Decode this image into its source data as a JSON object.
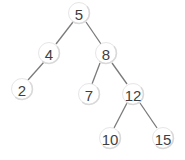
{
  "diagram": {
    "type": "binary-search-tree",
    "colors": {
      "edge": "#7a7a7a",
      "node_fill": "#ffffff",
      "node_shadow": "#d9d9d9",
      "label": "#3f3f3f"
    },
    "nodes": [
      {
        "id": "n5",
        "label": "5",
        "x": 79,
        "y": 13
      },
      {
        "id": "n4",
        "label": "4",
        "x": 49,
        "y": 53
      },
      {
        "id": "n8",
        "label": "8",
        "x": 106,
        "y": 53
      },
      {
        "id": "n2",
        "label": "2",
        "x": 22,
        "y": 89
      },
      {
        "id": "n7",
        "label": "7",
        "x": 89,
        "y": 94
      },
      {
        "id": "n12",
        "label": "12",
        "x": 133,
        "y": 94
      },
      {
        "id": "n10",
        "label": "10",
        "x": 110,
        "y": 138
      },
      {
        "id": "n15",
        "label": "15",
        "x": 163,
        "y": 138
      }
    ],
    "edges": [
      {
        "from": "5",
        "to": "4",
        "x1": 73,
        "y1": 22,
        "x2": 56,
        "y2": 44
      },
      {
        "from": "5",
        "to": "8",
        "x1": 86,
        "y1": 22,
        "x2": 101,
        "y2": 44
      },
      {
        "from": "4",
        "to": "2",
        "x1": 44,
        "y1": 62,
        "x2": 28,
        "y2": 80
      },
      {
        "from": "8",
        "to": "7",
        "x1": 100,
        "y1": 63,
        "x2": 92,
        "y2": 84
      },
      {
        "from": "8",
        "to": "12",
        "x1": 112,
        "y1": 63,
        "x2": 127,
        "y2": 84
      },
      {
        "from": "12",
        "to": "10",
        "x1": 127,
        "y1": 103,
        "x2": 114,
        "y2": 128
      },
      {
        "from": "12",
        "to": "15",
        "x1": 140,
        "y1": 103,
        "x2": 157,
        "y2": 128
      }
    ]
  }
}
